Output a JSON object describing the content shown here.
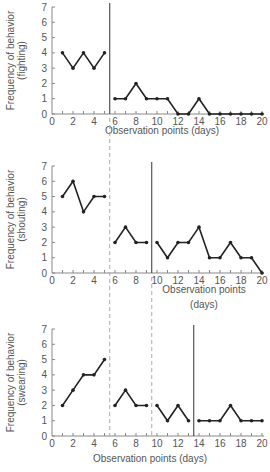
{
  "chart_data": [
    {
      "type": "line",
      "title": "",
      "ylabel": "Frequency of behavior (fighting)",
      "ylabel_lines": [
        "Frequency of behavior",
        "(fighting)"
      ],
      "xlabel": "Observation points (days)",
      "xlabel_lines": [
        "Observation points (days)"
      ],
      "ylim": [
        0,
        7
      ],
      "xlim": [
        0,
        20
      ],
      "x_ticks": [
        0,
        2,
        4,
        6,
        8,
        10,
        12,
        14,
        16,
        18,
        20
      ],
      "y_ticks": [
        0,
        1,
        2,
        3,
        4,
        5,
        6,
        7
      ],
      "phase_lines": [
        {
          "x": 5.5,
          "style": "solid"
        }
      ],
      "segments": [
        {
          "x": [
            1,
            2,
            3,
            4,
            5
          ],
          "y": [
            4,
            3,
            4,
            3,
            4
          ]
        },
        {
          "x": [
            6,
            7,
            8,
            9,
            10,
            11,
            12,
            13,
            14,
            15,
            16,
            17,
            18,
            19,
            20
          ],
          "y": [
            1,
            1,
            2,
            1,
            1,
            1,
            0,
            0,
            1,
            0,
            0,
            0,
            0,
            0,
            0
          ]
        }
      ]
    },
    {
      "type": "line",
      "title": "",
      "ylabel": "Frequency of behavior (shouting)",
      "ylabel_lines": [
        "Frequency of behavior",
        "(shouting)"
      ],
      "xlabel": "Observation points (days)",
      "xlabel_lines": [
        "Observation points",
        "(days)"
      ],
      "ylim": [
        0,
        7
      ],
      "xlim": [
        0,
        20
      ],
      "x_ticks": [
        0,
        2,
        4,
        6,
        8,
        10,
        12,
        14,
        16,
        18,
        20
      ],
      "y_ticks": [
        0,
        1,
        2,
        3,
        4,
        5,
        6,
        7
      ],
      "phase_lines": [
        {
          "x": 5.5,
          "style": "dashed"
        },
        {
          "x": 9.5,
          "style": "solid"
        }
      ],
      "segments": [
        {
          "x": [
            1,
            2,
            3,
            4,
            5
          ],
          "y": [
            5,
            6,
            4,
            5,
            5
          ]
        },
        {
          "x": [
            6,
            7,
            8,
            9
          ],
          "y": [
            2,
            3,
            2,
            2
          ]
        },
        {
          "x": [
            10,
            11,
            12,
            13,
            14,
            15,
            16,
            17,
            18,
            19,
            20
          ],
          "y": [
            2,
            1,
            2,
            2,
            3,
            1,
            1,
            2,
            1,
            1,
            0
          ]
        }
      ]
    },
    {
      "type": "line",
      "title": "",
      "ylabel": "Frequency of behavior (swearing)",
      "ylabel_lines": [
        "Frequency of behavior",
        "(swearing)"
      ],
      "xlabel": "Observation points (days)",
      "xlabel_lines": [
        "Observation points (days)"
      ],
      "ylim": [
        0,
        7
      ],
      "xlim": [
        0,
        20
      ],
      "x_ticks": [
        0,
        2,
        4,
        6,
        8,
        10,
        12,
        14,
        16,
        18,
        20
      ],
      "y_ticks": [
        0,
        1,
        2,
        3,
        4,
        5,
        6,
        7
      ],
      "phase_lines": [
        {
          "x": 5.5,
          "style": "dashed"
        },
        {
          "x": 9.5,
          "style": "dashed"
        },
        {
          "x": 13.5,
          "style": "solid"
        }
      ],
      "segments": [
        {
          "x": [
            1,
            2,
            3,
            4,
            5
          ],
          "y": [
            2,
            3,
            4,
            4,
            5
          ]
        },
        {
          "x": [
            6,
            7,
            8,
            9
          ],
          "y": [
            2,
            3,
            2,
            2
          ]
        },
        {
          "x": [
            10,
            11,
            12,
            13
          ],
          "y": [
            2,
            1,
            2,
            1
          ]
        },
        {
          "x": [
            14,
            15,
            16,
            17,
            18,
            19,
            20
          ],
          "y": [
            1,
            1,
            1,
            2,
            1,
            1,
            1
          ]
        }
      ]
    }
  ],
  "layout": {
    "panels": [
      {
        "origin_y": 114,
        "top_y": 7,
        "xlabel_y": [
          134
        ]
      },
      {
        "origin_y": 273,
        "top_y": 166,
        "xlabel_y": [
          293,
          308
        ]
      },
      {
        "origin_y": 436,
        "top_y": 329,
        "xlabel_y": [
          462
        ]
      }
    ],
    "x0": 52,
    "x20": 262,
    "dashed_span": [
      [
        0,
        0
      ],
      [
        130,
        460
      ],
      [
        293,
        460
      ]
    ],
    "colors": {
      "line": "#222222",
      "axis": "#888888",
      "text": "#555555",
      "dash": "#aaaaaa"
    }
  }
}
